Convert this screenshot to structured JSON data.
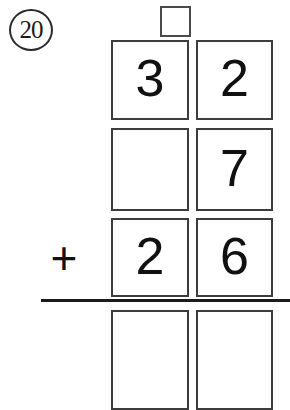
{
  "worksheet": {
    "problem_number": "20",
    "operator": "+",
    "carry_box": {
      "name": "carry-box",
      "value": ""
    },
    "columns": [
      "tens",
      "ones"
    ],
    "rows": [
      {
        "label": "addend-row-1",
        "cells": [
          "3",
          "2"
        ]
      },
      {
        "label": "addend-row-2",
        "cells": [
          "",
          "7"
        ]
      },
      {
        "label": "addend-row-3",
        "cells": [
          "2",
          "6"
        ]
      },
      {
        "label": "answer-row",
        "cells": [
          "",
          ""
        ]
      }
    ],
    "colors": {
      "ink": "#1a1a1a",
      "box_border": "#3c3c3c",
      "carry_border": "#4a4a4a",
      "paper": "#ffffff"
    }
  }
}
